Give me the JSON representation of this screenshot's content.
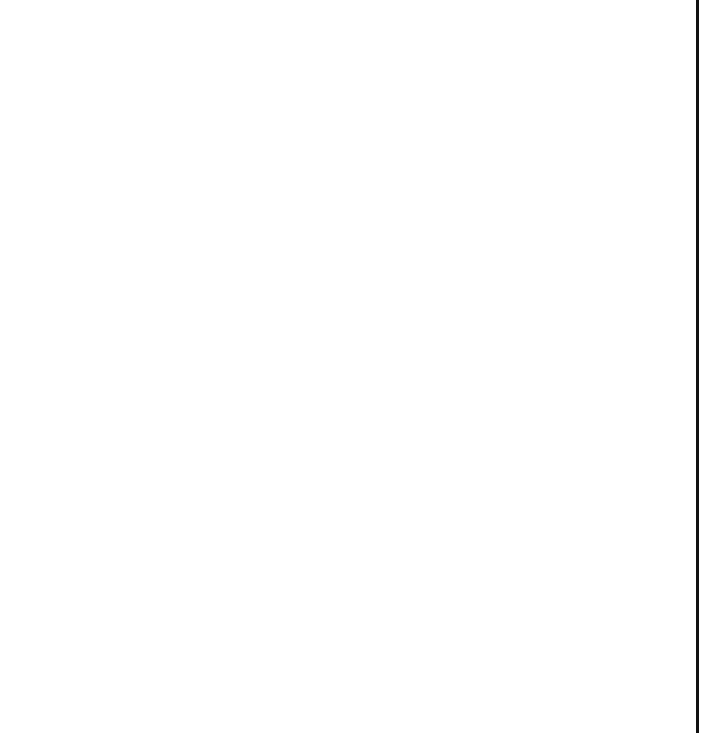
{
  "worksheet": {
    "title": "Coordinate grid with two smiley faces, stars and a V shape"
  },
  "chart_data": {
    "type": "scatter",
    "title": "",
    "xlabel": "",
    "ylabel": "",
    "xlim": [
      -1,
      15
    ],
    "ylim": [
      -1,
      15
    ],
    "grid": true,
    "x_ticks": [
      1,
      2,
      3,
      4,
      5,
      6,
      7,
      8,
      9,
      10,
      11,
      12,
      13,
      14
    ],
    "y_ticks": [
      1,
      2,
      3,
      4,
      5,
      6,
      7,
      8,
      9,
      10,
      11,
      12,
      13,
      14
    ],
    "stars": [
      {
        "x": 2.6,
        "y": 14.0
      },
      {
        "x": 6.7,
        "y": 11.3
      },
      {
        "x": 9.8,
        "y": 14.0
      },
      {
        "x": 14.4,
        "y": 13.6
      },
      {
        "x": 10.0,
        "y": 8.6
      },
      {
        "x": 13.3,
        "y": 6.5
      },
      {
        "x": 2.0,
        "y": 5.1
      },
      {
        "x": 9.5,
        "y": 3.2
      },
      {
        "x": 5.1,
        "y": 1.4
      },
      {
        "x": 14.1,
        "y": 1.5
      }
    ],
    "v_shape": {
      "points": [
        [
          4,
          5
        ],
        [
          5,
          4
        ],
        [
          6,
          5
        ]
      ]
    },
    "faces": [
      {
        "name": "left-face",
        "eyes": [
          [
            1.6,
            12
          ],
          [
            3.5,
            12
          ]
        ],
        "mouth_center_x": 2.5,
        "highlight_side": "left"
      },
      {
        "name": "right-face",
        "eyes": [
          [
            11.5,
            12
          ],
          [
            13.3,
            12
          ]
        ],
        "mouth_center_x": 12.4,
        "highlight_side": "right"
      }
    ]
  },
  "colors": {
    "grid": "#c4c4c4",
    "axis": "#111111",
    "ink": "#1a1a1a",
    "background": "#ffffff"
  }
}
